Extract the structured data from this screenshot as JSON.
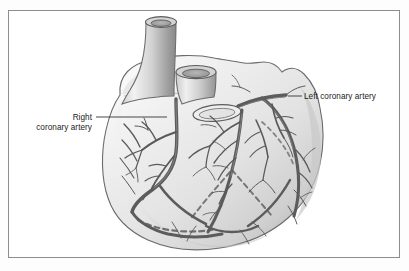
{
  "figure": {
    "name": "coronary-arteries-heart-diagram",
    "style": "grayscale line illustration",
    "frame": {
      "x": 8,
      "y": 10,
      "width": 392,
      "height": 248,
      "border_color": "#8d8d8d",
      "background_color": "#ffffff"
    }
  },
  "labels": [
    {
      "id": "left-coronary-artery",
      "line1": "Left coronary artery",
      "line2": "",
      "text_x": 303,
      "text_y": 99,
      "align": "start",
      "leader": {
        "x1": 288,
        "y1": 96,
        "x2": 302,
        "y2": 96
      }
    },
    {
      "id": "right-coronary-artery",
      "line1": "Right",
      "line2": "coronary artery",
      "text_x": 92,
      "text_y": 118,
      "align": "end",
      "leader": {
        "x1": 96,
        "y1": 117,
        "x2": 167,
        "y2": 117
      }
    }
  ],
  "anatomy": {
    "structures": [
      "aorta",
      "pulmonary trunk",
      "left atrial appendage",
      "right ventricle",
      "left ventricle",
      "left coronary artery",
      "right coronary artery",
      "anterior interventricular branch",
      "circumflex branch",
      "marginal branches",
      "hidden (dashed) posterior vessels"
    ]
  },
  "colors": {
    "vessel_stroke": "#5c5c5c",
    "vessel_dark": "#4a4a4a",
    "outline": "#6b6b6b",
    "myocardium_light": "#f2f2f2",
    "myocardium_mid": "#d9d9d9",
    "myocardium_shadow": "#b4b4b4",
    "vessel_lumen": "#9b9b9b",
    "text": "#1b1b1b",
    "frame": "#8d8d8d"
  }
}
